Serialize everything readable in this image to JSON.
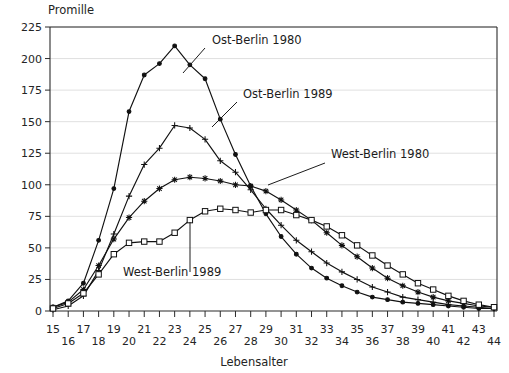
{
  "chart_data": {
    "type": "line",
    "title": "",
    "ylabel": "Promille",
    "xlabel": "Lebensalter",
    "ylim": [
      0,
      225
    ],
    "xlim": [
      15,
      44
    ],
    "yticks": [
      0,
      25,
      50,
      75,
      100,
      125,
      150,
      175,
      200,
      225
    ],
    "grid": true,
    "legend_position": "inline-annotations",
    "x": [
      15,
      16,
      17,
      18,
      19,
      20,
      21,
      22,
      23,
      24,
      25,
      26,
      27,
      28,
      29,
      30,
      31,
      32,
      33,
      34,
      35,
      36,
      37,
      38,
      39,
      40,
      41,
      42,
      43,
      44
    ],
    "xtick_labels_top": [
      "15",
      "17",
      "19",
      "21",
      "23",
      "25",
      "27",
      "29",
      "31",
      "33",
      "35",
      "37",
      "39",
      "41",
      "43"
    ],
    "xtick_labels_bottom": [
      "16",
      "18",
      "20",
      "22",
      "24",
      "26",
      "28",
      "30",
      "32",
      "34",
      "36",
      "38",
      "40",
      "42",
      "44"
    ],
    "series": [
      {
        "name": "Ost-Berlin 1980",
        "marker": "filled-dot",
        "values": [
          3,
          8,
          22,
          56,
          97,
          158,
          187,
          196,
          210,
          195,
          184,
          152,
          124,
          99,
          77,
          59,
          45,
          34,
          26,
          20,
          15,
          11,
          9,
          7,
          6,
          5,
          4,
          3,
          2,
          2
        ]
      },
      {
        "name": "Ost-Berlin 1989",
        "marker": "plus",
        "values": [
          1,
          4,
          12,
          32,
          61,
          91,
          116,
          129,
          147,
          145,
          136,
          119,
          110,
          96,
          81,
          68,
          56,
          47,
          38,
          31,
          25,
          19,
          15,
          11,
          9,
          7,
          5,
          4,
          3,
          2
        ]
      },
      {
        "name": "West-Berlin 1980",
        "marker": "asterisk",
        "values": [
          3,
          7,
          17,
          36,
          57,
          74,
          87,
          97,
          104,
          106,
          105,
          103,
          100,
          99,
          95,
          88,
          80,
          72,
          62,
          52,
          43,
          34,
          26,
          20,
          15,
          11,
          8,
          6,
          4,
          3
        ]
      },
      {
        "name": "West-Berlin 1989",
        "marker": "open-square",
        "values": [
          2,
          6,
          14,
          29,
          45,
          54,
          55,
          55,
          62,
          72,
          79,
          81,
          80,
          78,
          80,
          80,
          76,
          72,
          67,
          60,
          52,
          44,
          36,
          29,
          22,
          17,
          12,
          8,
          5,
          3
        ]
      }
    ],
    "annotations": [
      {
        "text": "Ost-Berlin 1980",
        "x": 212,
        "y": 44
      },
      {
        "text": "Ost-Berlin 1989",
        "x": 243,
        "y": 98
      },
      {
        "text": "West-Berlin 1980",
        "x": 331,
        "y": 158
      },
      {
        "text": "West-Berlin 1989",
        "x": 123,
        "y": 276
      }
    ]
  },
  "colors": {
    "line": "#111111",
    "grid": "#d8d8d8",
    "axis": "#2b2b2b",
    "background": "#ffffff"
  }
}
